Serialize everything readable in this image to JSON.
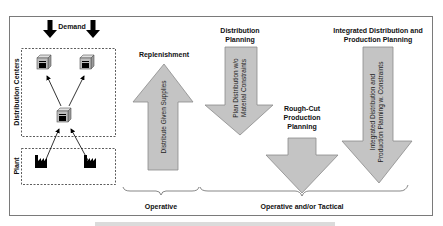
{
  "diagram": {
    "left_panel": {
      "demand_label": "Demand",
      "distribution_centers_label": "Distribution Centers",
      "plant_label": "Plant"
    },
    "arrows": [
      {
        "id": "replenishment",
        "title": "Replenishment",
        "direction": "up",
        "inner_lines": [
          "Distribute Given Supplies"
        ]
      },
      {
        "id": "distribution-planning",
        "title_lines": [
          "Distribution",
          "Planning"
        ],
        "direction": "down",
        "inner_lines": [
          "Plan Distribution w/o",
          "Material Constraints"
        ]
      },
      {
        "id": "rough-cut",
        "title_lines": [
          "Rough-Cut",
          "Production",
          "Planning"
        ],
        "direction": "down",
        "inner_lines": []
      },
      {
        "id": "integrated",
        "title_lines": [
          "Integrated Distribution and",
          "Production Planning"
        ],
        "direction": "down",
        "inner_lines": [
          "Integrated Distribution and",
          "Production Planning w. Constraints"
        ]
      }
    ],
    "brackets": [
      {
        "label": "Operative"
      },
      {
        "label": "Operative and/or Tactical"
      }
    ],
    "colors": {
      "arrow_fill": "#c4c4c4",
      "arrow_stroke": "#8a8a8a",
      "frame": "#7a7a7a",
      "text": "#111111"
    }
  }
}
